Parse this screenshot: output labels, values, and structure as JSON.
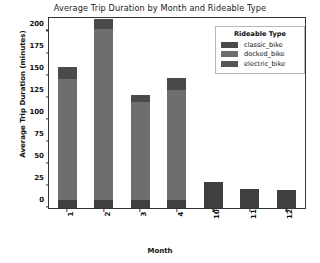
{
  "chart_data": {
    "type": "bar",
    "stacked": true,
    "title": "Average Trip Duration by Month and Rideable Type",
    "xlabel": "Month",
    "ylabel": "Average Trip Duration (minutes)",
    "categories": [
      "1",
      "2",
      "3",
      "4",
      "10",
      "11",
      "12"
    ],
    "ylim": [
      0,
      215
    ],
    "yticks": [
      0,
      25,
      50,
      75,
      100,
      125,
      150,
      175,
      200
    ],
    "ytick_labels": [
      "0",
      "25",
      "50",
      "75",
      "100",
      "125",
      "150",
      "175",
      "200"
    ],
    "grid": false,
    "legend_position": "upper right",
    "legend_title": "Rideable Type",
    "series": [
      {
        "name": "electric_bike",
        "color": "#3f3f3f",
        "values": [
          9,
          9,
          9,
          9,
          30,
          21,
          20
        ]
      },
      {
        "name": "docked_bike",
        "color": "#6e6e6e",
        "values": [
          137,
          194,
          111,
          125,
          0,
          0,
          0
        ]
      },
      {
        "name": "classic_bike",
        "color": "#4a4a4a",
        "values": [
          14,
          11,
          8,
          14,
          0,
          0,
          0
        ]
      }
    ],
    "totals": [
      160,
      214,
      128,
      148,
      30,
      21,
      20
    ]
  },
  "legend": {
    "title": "Rideable Type",
    "entries": [
      {
        "label": "classic_bike",
        "color": "#4a4a4a"
      },
      {
        "label": "docked_bike",
        "color": "#6e6e6e"
      },
      {
        "label": "electric_bike",
        "color": "#555555"
      }
    ]
  },
  "colors": {
    "axis": "#333333",
    "text": "#111111",
    "background": "#ffffff",
    "legend_border": "#b8b8b8"
  }
}
